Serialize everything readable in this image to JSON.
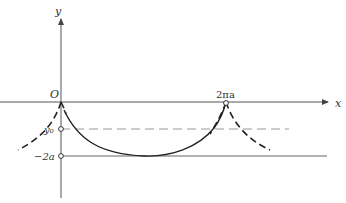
{
  "diagram": {
    "type": "cycloid-like curve sketch",
    "axes": {
      "x_label": "x",
      "y_label": "y",
      "origin_label": "O"
    },
    "marks": {
      "cusp_label": "2πa",
      "y0_label": "y₀",
      "minus_2a_label": "−2a"
    },
    "colors": {
      "axis": "#555555",
      "curve": "#222222",
      "dashed_guide": "#888888"
    }
  }
}
